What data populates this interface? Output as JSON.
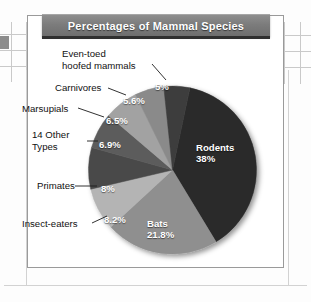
{
  "figure": {
    "title": "Percentages of Mammal Species"
  },
  "chart_data": {
    "type": "pie",
    "title": "Percentages of Mammal Species",
    "xlabel": "",
    "ylabel": "",
    "unit": "percent",
    "legend_position": "callout-labels",
    "grid": false,
    "categories": [
      "Rodents",
      "Bats",
      "Insect-eaters",
      "Primates",
      "14 Other Types",
      "Marsupials",
      "Carnivores",
      "Even-toed hoofed mammals"
    ],
    "values": [
      38,
      21.8,
      8.2,
      8,
      6.9,
      6.5,
      5.6,
      5
    ],
    "slices": [
      {
        "name": "Rodents",
        "value": 38,
        "value_label": "38%",
        "label": "Rodents",
        "label_placement": "inside",
        "color": "#2b2b2b"
      },
      {
        "name": "Bats",
        "value": 21.8,
        "value_label": "21.8%",
        "label": "Bats",
        "label_placement": "inside",
        "color": "#8f8f8f"
      },
      {
        "name": "Insect-eaters",
        "value": 8.2,
        "value_label": "8.2%",
        "label": "Insect-eaters",
        "label_placement": "callout",
        "color": "#b4b4b4"
      },
      {
        "name": "Primates",
        "value": 8,
        "value_label": "8%",
        "label": "Primates",
        "label_placement": "callout",
        "color": "#4a4a4a"
      },
      {
        "name": "14 Other Types",
        "value": 6.9,
        "value_label": "6.9%",
        "label": "14 Other\nTypes",
        "label_placement": "callout",
        "color": "#5c5c5c"
      },
      {
        "name": "Marsupials",
        "value": 6.5,
        "value_label": "6.5%",
        "label": "Marsupials",
        "label_placement": "callout",
        "color": "#a2a2a2"
      },
      {
        "name": "Carnivores",
        "value": 5.6,
        "value_label": "5.6%",
        "label": "Carnivores",
        "label_placement": "callout",
        "color": "#8a8a8a"
      },
      {
        "name": "Even-toed hoofed mammals",
        "value": 5,
        "value_label": "5%",
        "label": "Even-toed\nhoofed mammals",
        "label_placement": "callout",
        "color": "#3c3c3c"
      }
    ]
  },
  "callouts": {
    "eventoed": "Even-toed\nhoofed mammals",
    "carnivores": "Carnivores",
    "marsupials": "Marsupials",
    "other": "14 Other\nTypes",
    "primates": "Primates",
    "insect": "Insect-eaters"
  },
  "slice_value_labels": {
    "eventoed": "5%",
    "carnivores": "5.6%",
    "marsupials": "6.5%",
    "other": "6.9%",
    "primates": "8%",
    "insect": "8.2%",
    "rodents_name": "Rodents",
    "rodents_value": "38%",
    "bats_name": "Bats",
    "bats_value": "21.8%"
  }
}
